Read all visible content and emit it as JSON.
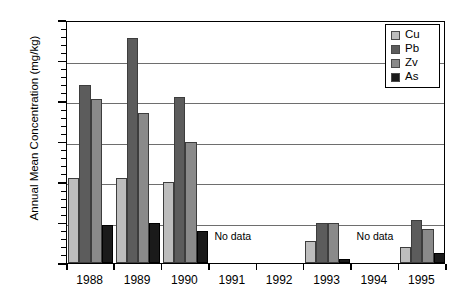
{
  "chart_data": {
    "type": "bar",
    "title": "",
    "xlabel": "",
    "ylabel": "Annual Mean Concentration (mg/kg)",
    "categories": [
      "1988",
      "1989",
      "1990",
      "1991",
      "1992",
      "1993",
      "1994",
      "1995"
    ],
    "ylim": [
      0,
      60
    ],
    "y_ticks": [
      0,
      10,
      20,
      30,
      40,
      50,
      60
    ],
    "y_minor_tick_step": 2,
    "grid": "horizontal",
    "legend_position": "top-right",
    "series": [
      {
        "name": "Cu",
        "color": "#bdbdbd",
        "values": [
          21,
          21,
          20,
          null,
          null,
          5.5,
          null,
          4
        ]
      },
      {
        "name": "Pb",
        "color": "#5c5c5c",
        "values": [
          44,
          55.5,
          41,
          null,
          null,
          10,
          null,
          10.5
        ]
      },
      {
        "name": "Zv",
        "color": "#8a8a8a",
        "values": [
          40.5,
          37,
          30,
          null,
          null,
          10,
          null,
          8.5
        ]
      },
      {
        "name": "As",
        "color": "#1a1a1a",
        "values": [
          9.3,
          10,
          8,
          null,
          null,
          1,
          null,
          2.5
        ]
      }
    ],
    "annotations": [
      {
        "text": "No data",
        "category": "1991",
        "value": 7
      },
      {
        "text": "No data",
        "category": "1994",
        "value": 7
      }
    ]
  },
  "legend": {
    "entries": [
      {
        "label": "Cu"
      },
      {
        "label": "Pb"
      },
      {
        "label": "Zv"
      },
      {
        "label": "As"
      }
    ]
  }
}
